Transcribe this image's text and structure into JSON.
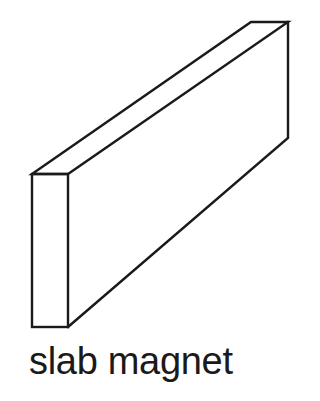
{
  "diagram": {
    "caption": "slab magnet",
    "stroke_color": "#1a1a1a",
    "background_color": "#ffffff",
    "shape": "rectangular-prism",
    "vertices": {
      "front_top_left": [
        32,
        174
      ],
      "front_top_right": [
        68,
        174
      ],
      "front_bottom_left": [
        32,
        327
      ],
      "front_bottom_right": [
        68,
        327
      ],
      "back_top_left": [
        251,
        22
      ],
      "back_top_right": [
        288,
        22
      ],
      "back_bottom_right": [
        288,
        138
      ]
    }
  }
}
